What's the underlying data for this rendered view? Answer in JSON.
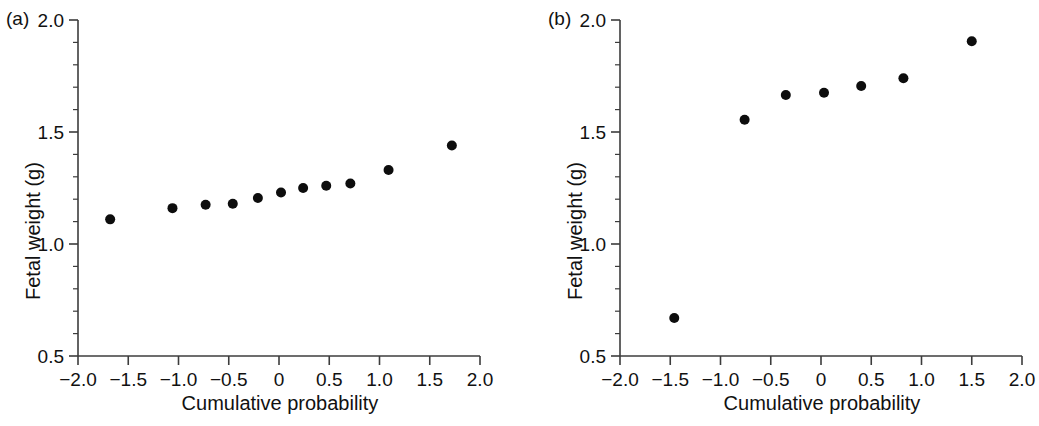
{
  "figure": {
    "background": "#ffffff",
    "point_color": "#0d0d0d",
    "axis_color": "#3c3c3c"
  },
  "panels": [
    {
      "tag": "(a)",
      "xlabel": "Cumulative probability",
      "ylabel": "Fetal weight (g)"
    },
    {
      "tag": "(b)",
      "xlabel": "Cumulative probability",
      "ylabel": "Fetal weight (g)"
    }
  ],
  "axis": {
    "xticks": [
      "-2.0",
      "-1.5",
      "-1.0",
      "-0.5",
      "0",
      "0.5",
      "1.0",
      "1.5",
      "2.0"
    ],
    "yticks": [
      "0.5",
      "1.0",
      "1.5",
      "2.0"
    ]
  },
  "chart_data": [
    {
      "type": "scatter",
      "panel": "(a)",
      "title": "",
      "xlabel": "Cumulative probability",
      "ylabel": "Fetal weight (g)",
      "xlim": [
        -2.0,
        2.0
      ],
      "ylim": [
        0.5,
        2.0
      ],
      "xticks": [
        -2.0,
        -1.5,
        -1.0,
        -0.5,
        0,
        0.5,
        1.0,
        1.5,
        2.0
      ],
      "xticklabels": [
        "-2.0",
        "-1.5",
        "-1.0",
        "-0.5",
        "0",
        "0.5",
        "1.0",
        "1.5",
        "2.0"
      ],
      "yticks": [
        0.5,
        1.0,
        1.5,
        2.0
      ],
      "yticklabels": [
        "0.5",
        "1.0",
        "1.5",
        "2.0"
      ],
      "minor_ytick_step": 0.1,
      "grid": false,
      "legend": null,
      "marker": "filled-circle",
      "x": [
        -1.68,
        -1.06,
        -0.73,
        -0.46,
        -0.21,
        0.02,
        0.24,
        0.47,
        0.71,
        1.09,
        1.72
      ],
      "y": [
        1.11,
        1.16,
        1.175,
        1.18,
        1.205,
        1.23,
        1.25,
        1.26,
        1.27,
        1.33,
        1.44
      ]
    },
    {
      "type": "scatter",
      "panel": "(b)",
      "title": "",
      "xlabel": "Cumulative probability",
      "ylabel": "Fetal weight (g)",
      "xlim": [
        -2.0,
        2.0
      ],
      "ylim": [
        0.5,
        2.0
      ],
      "xticks": [
        -2.0,
        -1.5,
        -1.0,
        -0.5,
        0,
        0.5,
        1.0,
        1.5,
        2.0
      ],
      "xticklabels": [
        "-2.0",
        "-1.5",
        "-1.0",
        "-0.5",
        "0",
        "0.5",
        "1.0",
        "1.5",
        "2.0"
      ],
      "yticks": [
        0.5,
        1.0,
        1.5,
        2.0
      ],
      "yticklabels": [
        "0.5",
        "1.0",
        "1.5",
        "2.0"
      ],
      "minor_ytick_step": 0.1,
      "grid": false,
      "legend": null,
      "marker": "filled-circle",
      "x": [
        -1.46,
        -0.76,
        -0.35,
        0.03,
        0.4,
        0.82,
        1.5
      ],
      "y": [
        0.67,
        1.555,
        1.665,
        1.675,
        1.705,
        1.74,
        1.905
      ]
    }
  ]
}
